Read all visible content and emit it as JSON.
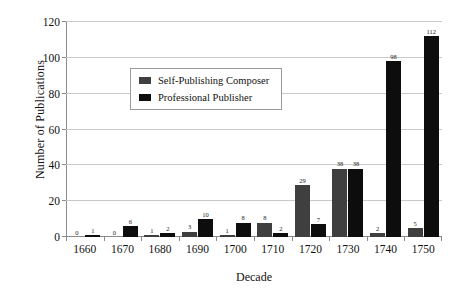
{
  "chart_data": {
    "type": "bar",
    "title": "",
    "xlabel": "Decade",
    "ylabel": "Number of Publications",
    "ylim": [
      0,
      120
    ],
    "ytick_step": 20,
    "yticks": [
      0,
      20,
      40,
      60,
      80,
      100,
      120
    ],
    "grid": "horizontal",
    "legend_position": "upper-left-inside",
    "categories": [
      "1660",
      "1670",
      "1680",
      "1690",
      "1700",
      "1710",
      "1720",
      "1730",
      "1740",
      "1750"
    ],
    "series": [
      {
        "name": "Self-Publishing Composer",
        "color": "#3f3f3f",
        "values": [
          0,
          0,
          1,
          3,
          1,
          8,
          29,
          38,
          2,
          5
        ]
      },
      {
        "name": "Professional Publisher",
        "color": "#0d0d0d",
        "values": [
          1,
          6,
          2,
          10,
          8,
          2,
          7,
          38,
          98,
          112
        ]
      }
    ]
  },
  "axes": {
    "y_tick_labels": [
      "0",
      "20",
      "40",
      "60",
      "80",
      "100",
      "120"
    ],
    "x_tick_labels": [
      "1660",
      "1670",
      "1680",
      "1690",
      "1700",
      "1710",
      "1720",
      "1730",
      "1740",
      "1750"
    ]
  },
  "legend": {
    "entries": [
      {
        "label": "Self-Publishing Composer",
        "swatch": "#3f3f3f"
      },
      {
        "label": "Professional Publisher",
        "swatch": "#0d0d0d"
      }
    ]
  },
  "data_labels": {
    "1660": [
      "0",
      "1"
    ],
    "1670": [
      "0",
      "6"
    ],
    "1680": [
      "1",
      "2"
    ],
    "1690": [
      "3",
      "10"
    ],
    "1700": [
      "1",
      "8"
    ],
    "1710": [
      "8",
      "2"
    ],
    "1720": [
      "29",
      "7"
    ],
    "1730": [
      "38",
      "38"
    ],
    "1740": [
      "2",
      "98"
    ],
    "1750": [
      "5",
      "112"
    ]
  }
}
